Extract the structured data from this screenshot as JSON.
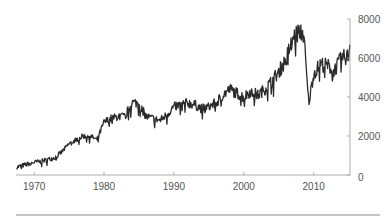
{
  "chart_data": {
    "type": "line",
    "title": "",
    "xlabel": "",
    "ylabel": "",
    "grid": false,
    "legend": null,
    "y_axis_position": "right",
    "xlim": [
      1967.4,
      2015.2
    ],
    "ylim": [
      0,
      8000
    ],
    "x_ticks": [
      1970,
      1980,
      1990,
      2000,
      2010
    ],
    "x_tick_labels": [
      "1970",
      "1980",
      "1990",
      "2000",
      "2010"
    ],
    "y_ticks": [
      0,
      2000,
      4000,
      6000,
      8000
    ],
    "y_tick_labels": [
      "0",
      "2000",
      "4000",
      "6000",
      "8000"
    ],
    "note": "Values are approximate annual readings estimated by eye from the rendered line; the original series is higher-frequency and noisy. No title, axis labels, legend, or units are shown in the image.",
    "series": [
      {
        "name": "series",
        "color": "#2b2b2b",
        "x": [
          1967.5,
          1968,
          1969,
          1970,
          1971,
          1972,
          1973,
          1974,
          1975,
          1976,
          1977,
          1978,
          1979,
          1980,
          1981,
          1982,
          1983,
          1984,
          1985,
          1986,
          1987,
          1988,
          1989,
          1990,
          1991,
          1992,
          1993,
          1994,
          1995,
          1996,
          1997,
          1998,
          1999,
          2000,
          2001,
          2002,
          2003,
          2004,
          2005,
          2006,
          2007,
          2008,
          2008.6,
          2009,
          2009.3,
          2010,
          2011,
          2012,
          2013,
          2014,
          2015,
          2015.2
        ],
        "values": [
          400,
          450,
          550,
          650,
          700,
          800,
          900,
          1200,
          1600,
          1800,
          2000,
          2000,
          1800,
          2700,
          2900,
          3000,
          3000,
          3700,
          3700,
          3000,
          2900,
          2800,
          3100,
          3500,
          3600,
          3700,
          3600,
          3400,
          3500,
          3700,
          4100,
          4400,
          4200,
          4000,
          4300,
          4100,
          4400,
          4800,
          5300,
          5900,
          7000,
          7400,
          7200,
          5000,
          3700,
          5200,
          5700,
          5600,
          5400,
          6000,
          6100,
          6800
        ]
      }
    ]
  },
  "axes": {
    "x_tick_labels": [
      "1970",
      "1980",
      "1990",
      "2000",
      "2010"
    ],
    "y_tick_labels": [
      "0",
      "2000",
      "4000",
      "6000",
      "8000"
    ]
  }
}
